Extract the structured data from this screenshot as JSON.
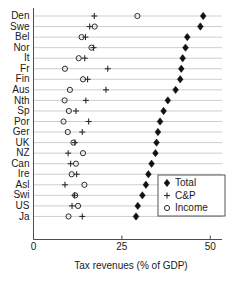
{
  "chart_data": {
    "type": "scatter",
    "title": "",
    "xlabel": "Tax revenues (% of GDP)",
    "ylabel": "",
    "xlim": [
      0,
      52.5
    ],
    "xticks": [
      0,
      25,
      50
    ],
    "xtick_labels": [
      "0",
      "25",
      "50"
    ],
    "grid": true,
    "grid_axis": "y",
    "legend_position": "bottom-right",
    "orientation": "horizontal",
    "categories": [
      "Den",
      "Swe",
      "Bel",
      "Nor",
      "It",
      "Fr",
      "Fin",
      "Aus",
      "Nth",
      "Sp",
      "Por",
      "Ger",
      "UK",
      "NZ",
      "Can",
      "Ire",
      "Asl",
      "Swi",
      "US",
      "Ja"
    ],
    "series": [
      {
        "name": "Total",
        "marker": "diamond",
        "values": [
          48.0,
          47.2,
          43.5,
          43.0,
          42.2,
          41.8,
          41.5,
          40.2,
          38.0,
          36.8,
          35.8,
          35.2,
          34.8,
          34.5,
          33.4,
          32.5,
          31.8,
          30.8,
          29.5,
          29.0
        ]
      },
      {
        "name": "C&P",
        "marker": "plus",
        "values": [
          17.2,
          15.9,
          14.7,
          17.0,
          14.5,
          21.0,
          15.3,
          20.5,
          14.8,
          12.0,
          15.6,
          13.8,
          11.7,
          9.8,
          10.5,
          12.2,
          8.9,
          11.6,
          10.9,
          13.8
        ]
      },
      {
        "name": "Income",
        "marker": "circle",
        "values": [
          29.4,
          17.3,
          13.6,
          16.4,
          12.8,
          8.9,
          14.0,
          10.3,
          8.8,
          10.0,
          8.5,
          9.7,
          11.3,
          14.0,
          12.0,
          10.8,
          14.4,
          11.8,
          12.6,
          9.9
        ]
      }
    ]
  },
  "legend": {
    "entries": [
      {
        "label": "Total",
        "marker": "diamond"
      },
      {
        "label": "C&P",
        "marker": "plus"
      },
      {
        "label": "Income",
        "marker": "circle"
      }
    ]
  },
  "axis": {
    "x_title": "Tax revenues (% of GDP)"
  }
}
